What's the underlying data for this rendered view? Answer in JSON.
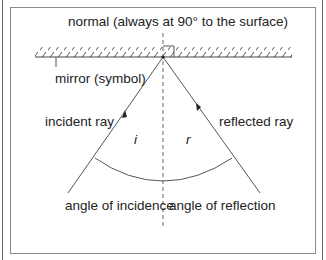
{
  "diagram": {
    "labels": {
      "normal": "normal (always at 90° to the surface)",
      "mirror": "mirror (symbol)",
      "incident_ray": "incident ray",
      "reflected_ray": "reflected ray",
      "angle_i": "i",
      "angle_r": "r",
      "angle_of_incidence": "angle of incidence",
      "angle_of_reflection": "angle of reflection"
    },
    "colors": {
      "line": "#555555",
      "text": "#222222",
      "border": "#8a8a8a"
    }
  }
}
